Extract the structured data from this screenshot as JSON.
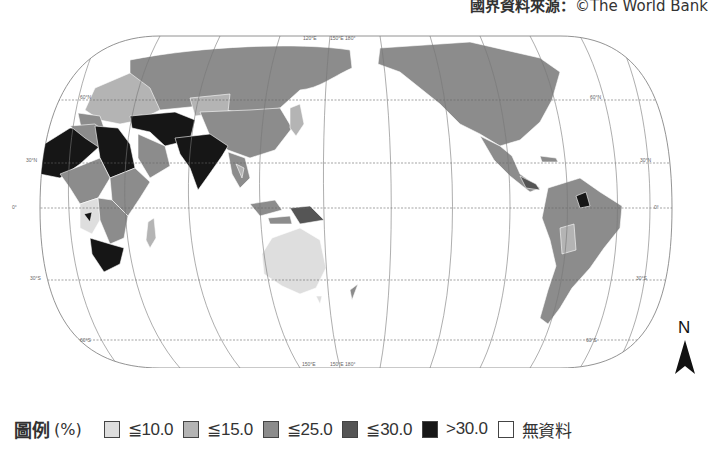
{
  "source": {
    "prefix": "國界資料來源：",
    "credit": "©The World Bank"
  },
  "map": {
    "projection": "Pacific-centered pseudocylindrical (oval) world map",
    "graticule": {
      "latitudes": [
        "60°N",
        "30°N",
        "0°",
        "30°S",
        "60°S"
      ],
      "top_meridian_labels": [
        "120°E",
        "150°E 180°"
      ],
      "bottom_meridian_labels": [
        "150°E",
        "150°E 180°"
      ]
    },
    "fill_colors": {
      "le10": "#dedede",
      "le15": "#b4b4b4",
      "le25": "#8c8c8c",
      "le30": "#555555",
      "gt30": "#161616",
      "nodata": "#ffffff"
    }
  },
  "north_arrow": {
    "label": "N"
  },
  "legend": {
    "title": "圖例",
    "unit": "(%)",
    "items": [
      {
        "label": "≦10.0",
        "color": "#dedede"
      },
      {
        "label": "≦15.0",
        "color": "#b4b4b4"
      },
      {
        "label": "≦25.0",
        "color": "#8c8c8c"
      },
      {
        "label": "≦30.0",
        "color": "#555555"
      },
      {
        "label": ">30.0",
        "color": "#161616"
      },
      {
        "label": "無資料",
        "color": "#ffffff"
      }
    ]
  }
}
